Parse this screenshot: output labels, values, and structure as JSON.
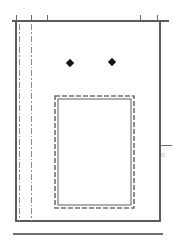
{
  "drawing": {
    "title": "Wall Elevation Detail",
    "background_color": "#ffffff",
    "line_color": "#5b5b5b",
    "centerline_color": "#8a8a8a",
    "marker_color": "#161616",
    "canvas": {
      "width": 180,
      "height": 251
    },
    "panel": {
      "label": "Panel Outline",
      "left": 16,
      "top": 21,
      "right": 160,
      "bottom": 221
    },
    "top_edge": {
      "label": "Top Edge Line",
      "x1": 12,
      "x2": 169,
      "y": 21
    },
    "top_ticks": {
      "label": "Top Dimension Ticks",
      "length": 6,
      "positions": [
        16,
        31,
        47,
        140,
        157
      ]
    },
    "center_lines": [
      {
        "label": "Center Line A",
        "x": 19,
        "y1": 24,
        "y2": 221
      },
      {
        "label": "Center Line B",
        "x": 31,
        "y1": 24,
        "y2": 221
      }
    ],
    "right_tick": {
      "label": "Right Edge Tick",
      "x1": 160,
      "x2": 172,
      "y": 145
    },
    "faint_mark": {
      "label": "Faint Reference Mark",
      "cx": 163,
      "cy": 155,
      "r": 1.6
    },
    "opening": {
      "label": "Rectangular Opening",
      "outer": {
        "x": 55,
        "y": 96,
        "width": 79,
        "height": 112
      },
      "inner_inset": 3
    },
    "anchors": [
      {
        "label": "Anchor Point Left",
        "cx": 70,
        "cy": 63,
        "size": 4
      },
      {
        "label": "Anchor Point Right",
        "cx": 112,
        "cy": 62,
        "size": 4
      }
    ],
    "base_line": {
      "label": "Base Reference Line",
      "x1": 13,
      "x2": 163,
      "y": 234
    }
  }
}
